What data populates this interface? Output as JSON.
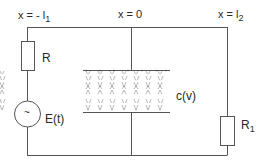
{
  "diagram": {
    "type": "circuit",
    "position_labels": {
      "left": "x = - l",
      "left_sub": "1",
      "middle": "x = 0",
      "right": "x = l",
      "right_sub": "2"
    },
    "components": {
      "resistor_left": "R",
      "source": "E(t)",
      "source_symbol": "~",
      "capacitor": "c(v)",
      "resistor_right": "R",
      "resistor_right_sub": "1"
    },
    "colors": {
      "wire": "#555555",
      "text": "#2a2a2a",
      "background": "#ffffff"
    }
  }
}
